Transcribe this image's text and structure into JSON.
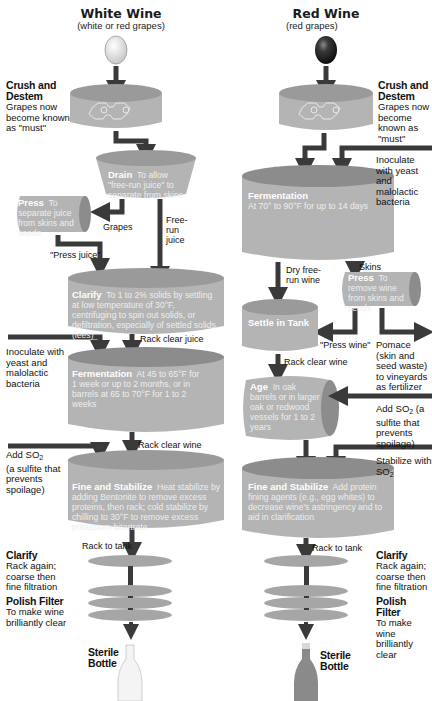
{
  "colors": {
    "vessel_fill": "#b4b4b4",
    "vessel_top": "#8c8c8c",
    "vessel_rim": "#a6a6a6",
    "arrow": "#3a3a3a",
    "inner_text": "#eeeeee",
    "white_grape": "#e2e2e2",
    "red_grape": "#2e2e2e",
    "red_bottle": "#8a8a8a",
    "white_bottle": "#f2f2f2"
  },
  "white": {
    "title": "White Wine",
    "subtitle": "(white or red grapes)",
    "crush": {
      "heading": "Crush and Destem",
      "text": "Grapes now become known as \"must\""
    },
    "drain": {
      "heading": "Drain",
      "text": "To allow \"free-run juice\" to separate from skins"
    },
    "press": {
      "heading": "Press",
      "text": "To separate juice from skins and seeds"
    },
    "grapes_label": "Grapes",
    "free_run_label": "Free-run juice",
    "press_juice_label": "\"Press juice\"",
    "clarify": {
      "heading": "Clarify",
      "text": "To 1 to 2% solids by settling at low temperature of 30°F, centrifuging to spin out solids, or defiltration, especially of settled solids (lees)"
    },
    "rack_clear_juice": "Rack clear juice",
    "inoculate": "Inoculate with yeast and malolactic bacteria",
    "fermentation": {
      "heading": "Fermentation",
      "text": "At 45 to 65°F for 1 week or up to 2 months, or in barrels at 65 to 70°F for 1 to 2 weeks"
    },
    "rack_clear_wine": "Rack clear wine",
    "add_so2": "Add SO",
    "add_so2_sub": "2",
    "add_so2_note": "(a sulfite that prevents spoilage)",
    "fine": {
      "heading": "Fine and Stabilize",
      "text": "Heat stabilize by adding Bentonite to remove excess proteins, then rack; cold stabilize by chilling to 30°F to remove excess potassium bitartrate"
    },
    "rack_to_tank": "Rack to tank",
    "clarify2": {
      "heading": "Clarify",
      "text": "Rack again; coarse then fine filtration"
    },
    "polish": {
      "heading": "Polish Filter",
      "text": "To make wine brilliantly clear"
    },
    "bottle": "Sterile Bottle"
  },
  "red": {
    "title": "Red Wine",
    "subtitle": "(red grapes)",
    "crush": {
      "heading": "Crush and Destem",
      "text": "Grapes now become known as \"must\""
    },
    "inoculate": "Inoculate with yeast and malolactic bacteria",
    "fermentation": {
      "heading": "Fermentation",
      "text": "At 70° to 90°F for up to 14 days"
    },
    "dry_free_run": "Dry free-run wine",
    "skins_label": "Skins",
    "press": {
      "heading": "Press",
      "text": "To remove wine from skins and seeds"
    },
    "settle": {
      "heading": "Settle in Tank"
    },
    "press_wine_label": "\"Press wine\"",
    "pomace": "Pomace (skin and seed waste) to vineyards as fertilizer",
    "rack_clear_wine": "Rack clear wine",
    "age": {
      "heading": "Age",
      "text": "In oak barrels or in larger oak or redwood vessels for 1 to 2 years"
    },
    "add_so2": "Add SO",
    "add_so2_sub": "2",
    "add_so2_note": " (a sulfite that prevents spoilage)",
    "stabilize_label": "Stabilize with SO",
    "stabilize_sub": "2",
    "fine": {
      "heading": "Fine and Stabilize",
      "text": "Add protein fining agents (e.g., egg whites) to decrease wine's astringency and to aid in clarification"
    },
    "rack_to_tank": "Rack to tank",
    "clarify2": {
      "heading": "Clarify",
      "text": "Rack again; coarse then fine filtration"
    },
    "polish": {
      "heading": "Polish Filter",
      "text": "To make wine brilliantly clear"
    },
    "bottle": "Sterile Bottle"
  }
}
